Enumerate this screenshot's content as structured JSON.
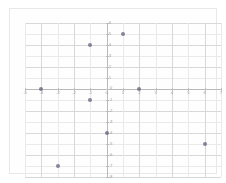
{
  "chart_data": {
    "type": "scatter",
    "title": "",
    "subtitle": "",
    "xlabel": "",
    "ylabel": "",
    "xlim": [
      -5,
      7
    ],
    "ylim": [
      -8,
      6
    ],
    "grid": true,
    "legend": null,
    "x_ticks": [
      -5,
      -4,
      -3,
      -2,
      -1,
      0,
      1,
      2,
      3,
      4,
      5,
      6,
      7
    ],
    "y_ticks": [
      6,
      5,
      4,
      3,
      2,
      1,
      0,
      -1,
      -2,
      -3,
      -4,
      -5,
      -6,
      -7,
      -8
    ],
    "x_tick_labels": [
      "-5",
      "-4",
      "-3",
      "-2",
      "-1",
      "0",
      "1",
      "2",
      "3",
      "4",
      "5",
      "6",
      "7"
    ],
    "y_tick_labels": [
      "6",
      "5",
      "4",
      "3",
      "2",
      "1",
      "0",
      "-1",
      "-2",
      "-3",
      "-4",
      "-5",
      "-6",
      "-7",
      "-8"
    ],
    "points": [
      {
        "x": -1,
        "y": 4
      },
      {
        "x": 1,
        "y": 5
      },
      {
        "x": -4,
        "y": 0
      },
      {
        "x": 2,
        "y": 0
      },
      {
        "x": -1,
        "y": -1
      },
      {
        "x": 0,
        "y": -4
      },
      {
        "x": 6,
        "y": -5
      },
      {
        "x": -3,
        "y": -7
      }
    ],
    "point_color": "#6b6b84",
    "grid_color": "#d8d8d8",
    "axis_color": "#b9b9b9",
    "label_color": "#9a9a9a",
    "background_color": "#ffffff"
  }
}
